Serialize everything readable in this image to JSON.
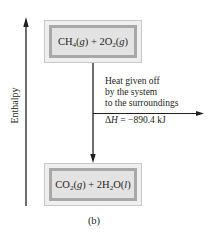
{
  "diagram": {
    "axis_label": "Enthalpy",
    "reactants": {
      "label_parts": [
        "CH",
        "4",
        "(",
        "g",
        ") + 2O",
        "2",
        "(",
        "g",
        ")"
      ]
    },
    "products": {
      "label_parts": [
        "CO",
        "2",
        "(",
        "g",
        ") + 2H",
        "2",
        "O(",
        "l",
        ")"
      ]
    },
    "heat_annotation": {
      "line1": "Heat given off",
      "line2": "by the system",
      "line3": "to the surroundings"
    },
    "delta_h": {
      "symbol": "ΔH",
      "equals": " = −890.4 kJ"
    },
    "caption": "(b)",
    "colors": {
      "line": "#231f20",
      "box_outer_border": "#c9c7c8",
      "box_frame": "#a9a7a8",
      "box_fill": "#e4e3e3"
    }
  }
}
